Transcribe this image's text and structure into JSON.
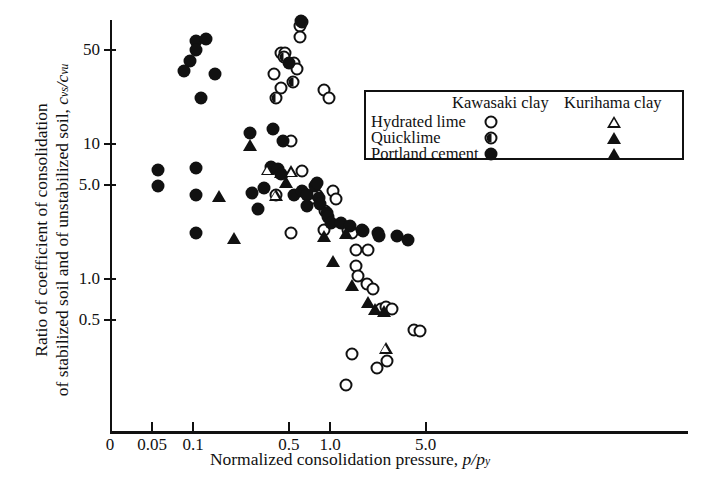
{
  "chart_data": {
    "type": "scatter",
    "title": "",
    "xlabel": "Normalized consolidation pressure, p/p_y",
    "ylabel": "Ratio of coefficient of consolidation of stabilized soil and of unstabilized soil, c_vs/c_vu",
    "xscale": "log",
    "yscale": "log",
    "xlim": [
      0.04,
      9.0
    ],
    "ylim": [
      0.15,
      90
    ],
    "xticks": [
      0.05,
      0.1,
      0.5,
      1.0,
      5.0
    ],
    "xticklabels": [
      "0.05",
      "0.1",
      "0.5",
      "1.0",
      "5.0"
    ],
    "x_origin_label": "0",
    "yticks": [
      50,
      10,
      5.0,
      1.0,
      0.5
    ],
    "yticklabels": [
      "50",
      "10",
      "5.0",
      "1.0",
      "0.5"
    ],
    "grid": false,
    "legend_position": "upper-right-inside",
    "series": [
      {
        "name": "Kawasaki clay - Hydrated lime",
        "marker": "open-circle",
        "points": [
          [
            0.6,
            75
          ],
          [
            0.6,
            62
          ],
          [
            0.44,
            47
          ],
          [
            0.47,
            47
          ],
          [
            0.39,
            33
          ],
          [
            0.55,
            40
          ],
          [
            0.57,
            36
          ],
          [
            0.44,
            26
          ],
          [
            0.9,
            25
          ],
          [
            0.98,
            22
          ],
          [
            0.52,
            10.5
          ],
          [
            0.62,
            6.3
          ],
          [
            0.4,
            4.2
          ],
          [
            0.75,
            4.0
          ],
          [
            0.8,
            4.2
          ],
          [
            1.05,
            4.5
          ],
          [
            1.1,
            3.9
          ],
          [
            0.92,
            3.2
          ],
          [
            0.52,
            2.2
          ],
          [
            0.9,
            2.3
          ],
          [
            1.35,
            2.3
          ],
          [
            1.45,
            2.2
          ],
          [
            1.7,
            2.3
          ],
          [
            1.55,
            1.65
          ],
          [
            1.9,
            1.65
          ],
          [
            1.55,
            1.25
          ],
          [
            1.6,
            1.05
          ],
          [
            1.85,
            0.92
          ],
          [
            2.05,
            0.85
          ],
          [
            2.35,
            0.6
          ],
          [
            2.55,
            0.62
          ],
          [
            2.85,
            0.6
          ],
          [
            4.1,
            0.42
          ],
          [
            4.55,
            0.41
          ],
          [
            1.45,
            0.28
          ],
          [
            2.2,
            0.22
          ],
          [
            2.6,
            0.245
          ],
          [
            1.3,
            0.165
          ]
        ]
      },
      {
        "name": "Kawasaki clay - Quicklime",
        "marker": "half-circle",
        "points": [
          [
            0.62,
            80
          ],
          [
            0.46,
            44
          ],
          [
            0.54,
            29
          ],
          [
            0.4,
            22
          ]
        ]
      },
      {
        "name": "Kawasaki clay - Portland cement",
        "marker": "filled-circle",
        "points": [
          [
            0.61,
            82
          ],
          [
            0.095,
            41
          ],
          [
            0.105,
            58
          ],
          [
            0.105,
            50
          ],
          [
            0.125,
            60
          ],
          [
            0.085,
            35
          ],
          [
            0.145,
            33
          ],
          [
            0.5,
            40
          ],
          [
            0.115,
            22
          ],
          [
            0.26,
            12
          ],
          [
            0.38,
            13
          ],
          [
            0.45,
            10.5
          ],
          [
            0.055,
            6.4
          ],
          [
            0.055,
            4.9
          ],
          [
            0.105,
            6.6
          ],
          [
            0.105,
            4.2
          ],
          [
            0.37,
            6.8
          ],
          [
            0.42,
            6.5
          ],
          [
            0.44,
            6.0
          ],
          [
            0.33,
            4.7
          ],
          [
            0.27,
            4.3
          ],
          [
            0.3,
            3.3
          ],
          [
            0.55,
            4.2
          ],
          [
            0.62,
            4.5
          ],
          [
            0.78,
            4.9
          ],
          [
            0.8,
            5.1
          ],
          [
            0.83,
            4.0
          ],
          [
            0.85,
            3.6
          ],
          [
            0.68,
            4.2
          ],
          [
            0.68,
            3.5
          ],
          [
            0.95,
            3.1
          ],
          [
            0.105,
            2.2
          ],
          [
            0.96,
            2.9
          ],
          [
            1.02,
            2.6
          ],
          [
            1.2,
            2.6
          ],
          [
            1.4,
            2.45
          ],
          [
            1.75,
            2.25
          ],
          [
            2.25,
            2.2
          ],
          [
            2.3,
            2.1
          ],
          [
            3.1,
            2.1
          ],
          [
            3.7,
            1.95
          ]
        ]
      },
      {
        "name": "Kurihama clay - Hydrated lime",
        "marker": "open-triangle",
        "points": [
          [
            0.35,
            6.5
          ],
          [
            0.52,
            7.7
          ],
          [
            0.4,
            6.3
          ],
          [
            2.55,
            0.57
          ]
        ]
      },
      {
        "name": "Kurihama clay - Quicklime",
        "marker": "filled-triangle",
        "points": []
      },
      {
        "name": "Kurihama clay - Portland cement",
        "marker": "filled-triangle",
        "points": [
          [
            0.26,
            9.8
          ],
          [
            0.155,
            4.1
          ],
          [
            0.44,
            6.2
          ],
          [
            0.48,
            5.2
          ],
          [
            0.2,
            2.0
          ],
          [
            0.9,
            2.1
          ],
          [
            1.3,
            2.2
          ],
          [
            1.05,
            1.35
          ],
          [
            1.45,
            0.9
          ],
          [
            1.9,
            0.67
          ],
          [
            2.15,
            0.6
          ],
          [
            2.5,
            0.58
          ]
        ]
      }
    ]
  },
  "legend": {
    "columns": [
      "Kawasaki clay",
      "Kurihama clay"
    ],
    "rows": [
      {
        "label": "Hydrated lime",
        "kawasaki": "open-circle",
        "kurihama": "open-triangle"
      },
      {
        "label": "Quicklime",
        "kawasaki": "half-circle",
        "kurihama": "filled-triangle"
      },
      {
        "label": "Portland cement",
        "kawasaki": "filled-circle",
        "kurihama": "filled-triangle"
      }
    ]
  },
  "axis": {
    "x_title_main": "Normalized consolidation pressure,",
    "x_title_sym_num": "p",
    "x_title_sym_den": "p",
    "x_title_sym_sub": "y",
    "y_title_line1": "Ratio of coefficient of consolidation",
    "y_title_line2": "of stabilized soil and of unstabilized soil,",
    "y_title_sym_num": "c",
    "y_title_sym_num_sub": "vs",
    "y_title_sym_den": "c",
    "y_title_sym_den_sub": "vu"
  },
  "colors": {
    "ink": "#111111",
    "background": "#ffffff"
  }
}
